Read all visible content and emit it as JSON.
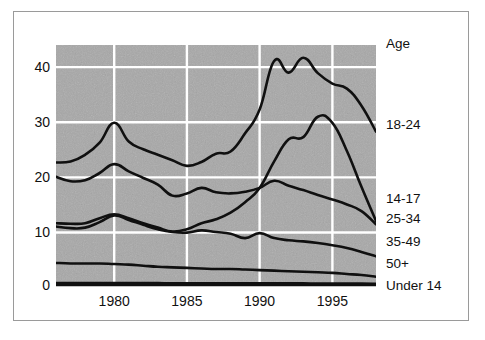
{
  "chart_data": {
    "type": "line",
    "title": "",
    "subtitle": "",
    "xlabel": "",
    "ylabel": "",
    "legend_title": "Age",
    "legend_position": "right",
    "grid": true,
    "grid_color": "#ffffff",
    "plot_background": "#a8a8a8",
    "line_color": "#101010",
    "xlim": [
      1976,
      1998
    ],
    "ylim": [
      0,
      43.5
    ],
    "xticks": [
      1980,
      1985,
      1990,
      1995
    ],
    "xtick_labels": [
      "1980",
      "1985",
      "1990",
      "1995"
    ],
    "yticks": [
      0,
      10,
      20,
      30,
      40
    ],
    "ytick_labels": [
      "0",
      "10",
      "20",
      "30",
      "40"
    ],
    "x": [
      1976,
      1977,
      1978,
      1979,
      1980,
      1981,
      1982,
      1983,
      1984,
      1985,
      1986,
      1987,
      1988,
      1989,
      1990,
      1991,
      1992,
      1993,
      1994,
      1995,
      1996,
      1997,
      1998
    ],
    "series": [
      {
        "name": "18-24",
        "label": "18-24",
        "values": [
          22.2,
          22.4,
          23.6,
          25.8,
          29.4,
          26.0,
          24.6,
          23.6,
          22.6,
          21.6,
          22.3,
          23.8,
          24.2,
          27.5,
          31.8,
          40.6,
          38.5,
          41.2,
          38.4,
          36.5,
          35.6,
          32.5,
          27.8
        ]
      },
      {
        "name": "14-17",
        "label": "14-17",
        "values": [
          19.6,
          18.8,
          19.0,
          20.3,
          21.9,
          20.6,
          19.4,
          18.2,
          16.2,
          16.6,
          17.6,
          16.8,
          16.6,
          16.9,
          17.6,
          18.9,
          18.0,
          17.2,
          16.3,
          15.5,
          14.6,
          13.4,
          11.0
        ]
      },
      {
        "name": "25-34",
        "label": "25-34",
        "values": [
          11.2,
          11.1,
          11.2,
          12.1,
          12.8,
          12.1,
          11.2,
          10.4,
          9.7,
          10.1,
          11.2,
          11.9,
          13.1,
          15.0,
          17.6,
          22.4,
          26.4,
          26.8,
          30.5,
          29.4,
          24.3,
          17.8,
          11.6
        ]
      },
      {
        "name": "35-49",
        "label": "35-49",
        "values": [
          10.6,
          10.3,
          10.4,
          11.4,
          12.6,
          11.8,
          10.9,
          10.1,
          9.6,
          9.5,
          9.9,
          9.6,
          9.3,
          8.5,
          9.4,
          8.5,
          8.1,
          7.9,
          7.6,
          7.2,
          6.7,
          6.0,
          5.2
        ]
      },
      {
        "name": "50+",
        "label": "50+",
        "values": [
          4.0,
          3.9,
          3.9,
          3.9,
          3.8,
          3.7,
          3.5,
          3.3,
          3.2,
          3.1,
          3.0,
          2.9,
          2.9,
          2.8,
          2.7,
          2.6,
          2.5,
          2.4,
          2.3,
          2.2,
          2.0,
          1.8,
          1.5
        ]
      },
      {
        "name": "Under 14",
        "label": "Under 14",
        "values": [
          0.35,
          0.35,
          0.35,
          0.35,
          0.35,
          0.35,
          0.35,
          0.35,
          0.3,
          0.3,
          0.3,
          0.3,
          0.3,
          0.3,
          0.3,
          0.3,
          0.3,
          0.3,
          0.25,
          0.25,
          0.25,
          0.25,
          0.2
        ]
      }
    ],
    "legend_entries": [
      {
        "label": "Age",
        "y_value": null
      },
      {
        "label": "18-24",
        "y_value": 27.8
      },
      {
        "label": "14-17",
        "y_value": 13.0
      },
      {
        "label": "25-34",
        "y_value": 10.6
      },
      {
        "label": "35-49",
        "y_value": 5.2
      },
      {
        "label": "50+",
        "y_value": 1.7
      },
      {
        "label": "Under 14",
        "y_value": -0.9
      }
    ]
  }
}
